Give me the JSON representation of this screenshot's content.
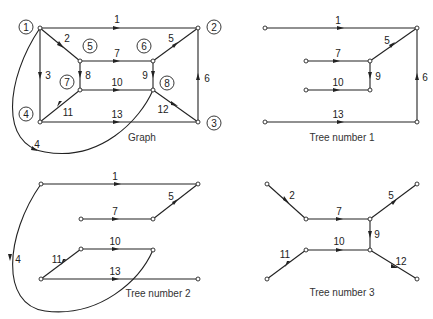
{
  "panels": {
    "graph": {
      "caption": "Graph",
      "node_labels": [
        "1",
        "2",
        "3",
        "4",
        "5",
        "6",
        "7",
        "8"
      ],
      "edge_labels": [
        "1",
        "2",
        "3",
        "4",
        "5",
        "6",
        "7",
        "8",
        "9",
        "10",
        "11",
        "12",
        "13"
      ]
    },
    "tree1": {
      "caption": "Tree number 1",
      "edge_labels": [
        "1",
        "5",
        "6",
        "7",
        "9",
        "10",
        "13"
      ]
    },
    "tree2": {
      "caption": "Tree number 2",
      "edge_labels": [
        "1",
        "4",
        "5",
        "7",
        "10",
        "11",
        "13"
      ]
    },
    "tree3": {
      "caption": "Tree number 3",
      "edge_labels": [
        "2",
        "5",
        "7",
        "9",
        "10",
        "11",
        "12"
      ]
    }
  }
}
